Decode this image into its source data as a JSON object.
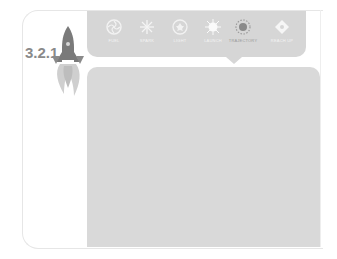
{
  "logo": {
    "text": "3.2.1",
    "icon": "rocket-icon"
  },
  "nav": {
    "active_index": 4,
    "items": [
      {
        "label": "FUEL",
        "icon": "swirl-icon"
      },
      {
        "label": "SPARK",
        "icon": "spark-icon"
      },
      {
        "label": "LIGHT",
        "icon": "flower-icon"
      },
      {
        "label": "LAUNCH",
        "icon": "burst-icon"
      },
      {
        "label": "TRAJECTORY",
        "icon": "target-icon"
      },
      {
        "label": "REACH UP",
        "icon": "diamond-icon"
      }
    ]
  },
  "colors": {
    "nav_bg": "#d6d6d6",
    "content_bg": "#d9d9d9",
    "logo_text": "#8a8a8a",
    "rocket": "#7a7a7a",
    "flame": "#bdbdbd"
  }
}
